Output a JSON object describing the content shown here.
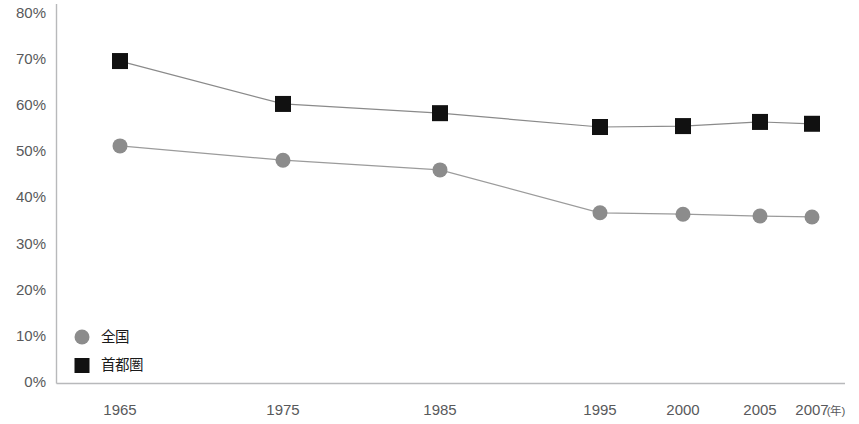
{
  "chart_data": {
    "type": "line",
    "title": "",
    "subtitle": "",
    "xlabel": "年",
    "ylabel": "",
    "grid": false,
    "legend_position": "inside-bottom-left",
    "categories": [
      "1965",
      "1975",
      "1985",
      "1995",
      "2000",
      "2005",
      "2007"
    ],
    "x_tick_labels": [
      "1965",
      "1975",
      "1985",
      "1995",
      "2000",
      "2005",
      "2007"
    ],
    "x_axis_unit_label": "(年)",
    "y_tick_labels": [
      "80%",
      "70%",
      "60%",
      "50%",
      "40%",
      "30%",
      "20%",
      "10%",
      "0%"
    ],
    "y_tick_values": [
      80,
      70,
      60,
      50,
      40,
      30,
      20,
      10,
      0
    ],
    "ylim": [
      0,
      80
    ],
    "y_unit": "%",
    "series": [
      {
        "name": "全国",
        "marker": "circle",
        "color": "#8c8c8c",
        "line_color": "#9b9b9b",
        "values": [
          51.4,
          48.3,
          46.2,
          36.9,
          36.6,
          36.2,
          36.0
        ]
      },
      {
        "name": "首都圏",
        "marker": "square",
        "color": "#111111",
        "line_color": "#8a8a8a",
        "values": [
          69.8,
          60.5,
          58.5,
          55.5,
          55.7,
          56.6,
          56.2
        ]
      }
    ],
    "colors": {
      "zenkoku": "#8c8c8c",
      "shutoken": "#111111",
      "axis": "#b8b9bb",
      "tick_text": "#58595b",
      "legend_text": "#1a1a1a",
      "background": "#ffffff"
    }
  },
  "legend": {
    "items": [
      {
        "label": "全国",
        "marker": "circle-marker",
        "color": "#8c8c8c"
      },
      {
        "label": "首都圏",
        "marker": "square-marker",
        "color": "#111111"
      }
    ]
  }
}
